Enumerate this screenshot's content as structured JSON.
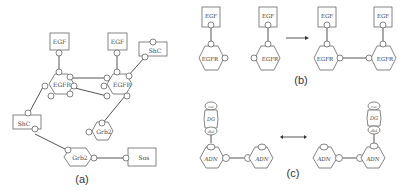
{
  "panels": {
    "a": {
      "caption": "(a)",
      "nodes": {
        "egf1": "EGF",
        "egf2": "EGF",
        "egfr1": "EGFR",
        "egfr2": "EGFR",
        "shc1": "ShC",
        "shc2": "ShC",
        "grb2_1": "Grb2",
        "grb2_2": "Grb2",
        "sos": "Sos"
      },
      "sites": {
        "r": "r",
        "l": "l",
        "c": "c",
        "d": "d",
        "y": "Y",
        "p": "p",
        "a": "a",
        "b": "b",
        "s": "s"
      }
    },
    "b": {
      "caption": "(b)",
      "nodes": {
        "egf": "EGF",
        "egfr": "EGFR"
      },
      "sites": {
        "r": "r",
        "l": "l",
        "c": "c"
      },
      "arrow": "→"
    },
    "c": {
      "caption": "(c)",
      "nodes": {
        "adn": "ADN",
        "dg": "DG"
      },
      "sites": {
        "cat": "cat",
        "dbd": "dbd",
        "dg": "dg",
        "c": "c"
      },
      "arrow": "↔"
    }
  }
}
